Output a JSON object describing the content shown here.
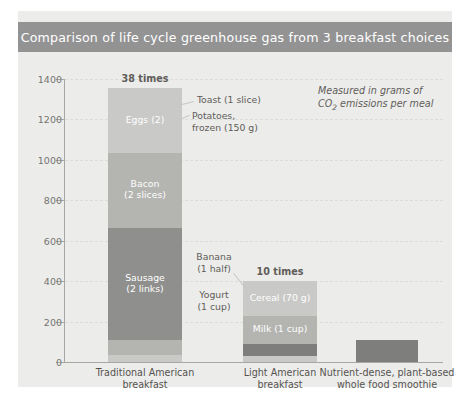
{
  "title": "Comparison of life cycle greenhouse gas from 3 breakfast choices",
  "annotation_line1": "Measured in grams of",
  "annotation_line2_pre": "CO",
  "annotation_line2_sub": "2",
  "annotation_line2_post": " emissions per meal",
  "colors": {
    "figure_background": "#ececeb",
    "title_bar": "#939393",
    "title_text": "#ffffff",
    "axis": "#a9a7a2",
    "grid": "#dcdcda",
    "tick_text": "#76746f",
    "label_text": "#5f5d59",
    "segment_light": "#c9c9c7",
    "segment_mid": "#b4b4b1",
    "segment_dark": "#8f8f8d",
    "segment_darker": "#7e7e7c"
  },
  "chart_data": {
    "type": "bar",
    "subtype": "stacked",
    "title": "Comparison of life cycle greenhouse gas from 3 breakfast choices",
    "xlabel": "",
    "ylabel": "",
    "ylim": [
      0,
      1400
    ],
    "yticks": [
      0,
      200,
      400,
      600,
      800,
      1000,
      1200,
      1400
    ],
    "ytick_labels": [
      "0",
      "200",
      "400",
      "600",
      "800",
      "1000",
      "1200",
      "1400"
    ],
    "grid": true,
    "legend": "none",
    "units": "grams of CO2 emissions per meal",
    "categories": [
      "Traditional American breakfast",
      "Light American breakfast",
      "Nutrient-dense, plant-based whole food smoothie"
    ],
    "category_lines": [
      [
        "Traditional American",
        "breakfast"
      ],
      [
        "Light American",
        "breakfast"
      ],
      [
        "Nutrient-dense, plant-based",
        "whole food smoothie"
      ]
    ],
    "totals": [
      1355,
      400,
      110
    ],
    "total_multiplier_labels": [
      "38 times",
      "10 times",
      ""
    ],
    "bars": [
      {
        "category": "Traditional American breakfast",
        "total": 1355,
        "multiplier_label": "38 times",
        "segments": [
          {
            "name": "Eggs (2)",
            "value": 320,
            "label_inside": true,
            "label_lines": [
              "Eggs (2)"
            ],
            "shade": "segment_light"
          },
          {
            "name": "Bacon (2 slices)",
            "value": 370,
            "label_inside": true,
            "label_lines": [
              "Bacon",
              "(2 slices)"
            ],
            "shade": "segment_mid"
          },
          {
            "name": "Sausage (2 links)",
            "value": 555,
            "label_inside": true,
            "label_lines": [
              "Sausage",
              "(2 links)"
            ],
            "shade": "segment_dark"
          },
          {
            "name": "Potatoes, frozen (150 g)",
            "value": 75,
            "label_inside": false,
            "label_lines": [
              "Potatoes,",
              "frozen (150 g)"
            ],
            "shade": "segment_mid"
          },
          {
            "name": "Toast (1 slice)",
            "value": 35,
            "label_inside": false,
            "label_lines": [
              "Toast (1 slice)"
            ],
            "shade": "segment_light"
          }
        ]
      },
      {
        "category": "Light American breakfast",
        "total": 400,
        "multiplier_label": "10 times",
        "segments": [
          {
            "name": "Cereal (70 g)",
            "value": 170,
            "label_inside": true,
            "label_lines": [
              "Cereal (70 g)"
            ],
            "shade": "segment_light"
          },
          {
            "name": "Milk (1 cup)",
            "value": 140,
            "label_inside": true,
            "label_lines": [
              "Milk (1 cup)"
            ],
            "shade": "segment_mid"
          },
          {
            "name": "Yogurt (1 cup)",
            "value": 60,
            "label_inside": false,
            "label_lines": [
              "Yogurt",
              "(1 cup)"
            ],
            "shade": "segment_darker"
          },
          {
            "name": "Banana (1 half)",
            "value": 30,
            "label_inside": false,
            "label_lines": [
              "Banana",
              "(1 half)"
            ],
            "shade": "segment_light"
          }
        ]
      },
      {
        "category": "Nutrient-dense, plant-based whole food smoothie",
        "total": 110,
        "multiplier_label": "",
        "segments": [
          {
            "name": "Smoothie",
            "value": 110,
            "label_inside": false,
            "label_lines": [],
            "shade": "segment_darker"
          }
        ]
      }
    ]
  }
}
